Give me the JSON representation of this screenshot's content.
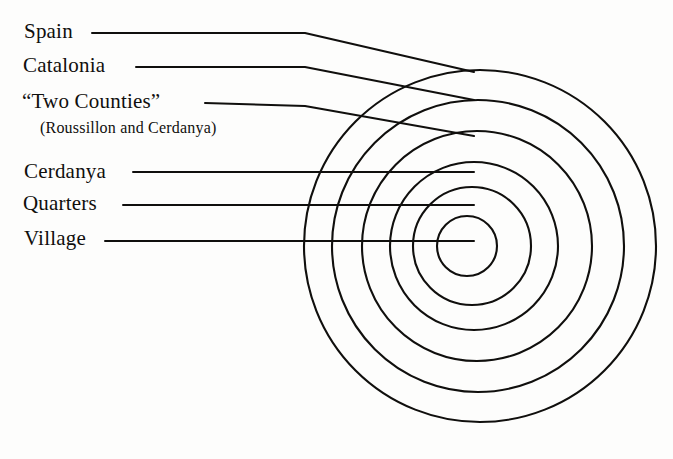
{
  "figure": {
    "background_color": "#fdfdfc",
    "stroke_color": "#100f0d"
  },
  "labels": [
    {
      "id": "spain",
      "text": "Spain"
    },
    {
      "id": "catalonia",
      "text": "Catalonia"
    },
    {
      "id": "two",
      "text": "“Two Counties”"
    },
    {
      "id": "two_sub",
      "text": "(Roussillon and Cerdanya)"
    },
    {
      "id": "cerdanya",
      "text": "Cerdanya"
    },
    {
      "id": "quarters",
      "text": "Quarters"
    },
    {
      "id": "village",
      "text": "Village"
    }
  ],
  "chart_data": {
    "type": "diagram",
    "subtype": "concentric-circles",
    "title": "",
    "center": {
      "x": 480,
      "y": 246
    },
    "rings": [
      {
        "label": "Spain",
        "index": 1,
        "radius": 176,
        "cx": 480,
        "cy": 246
      },
      {
        "label": "Catalonia",
        "index": 2,
        "radius": 146,
        "cx": 478,
        "cy": 246
      },
      {
        "label": "“Two Counties”",
        "index": 3,
        "radius": 115,
        "cx": 477,
        "cy": 246
      },
      {
        "label": "Cerdanya",
        "index": 4,
        "radius": 84,
        "cx": 474,
        "cy": 246
      },
      {
        "label": "Quarters",
        "index": 5,
        "radius": 59,
        "cx": 472,
        "cy": 246
      },
      {
        "label": "Village",
        "index": 6,
        "radius": 30,
        "cx": 467,
        "cy": 246
      }
    ],
    "leaders": [
      {
        "label": "Spain",
        "kind": "bent",
        "x1": 92,
        "y1": 33,
        "x2": 305,
        "y2": 33,
        "x3": 474,
        "y3": 72
      },
      {
        "label": "Catalonia",
        "kind": "bent",
        "x1": 136,
        "y1": 67,
        "x2": 305,
        "y2": 67,
        "x3": 474,
        "y3": 100
      },
      {
        "label": "“Two Counties”",
        "kind": "bent",
        "x1": 205,
        "y1": 103,
        "x2": 305,
        "y2": 106,
        "x3": 474,
        "y3": 136
      },
      {
        "label": "Cerdanya",
        "kind": "horizontal",
        "x1": 133,
        "y1": 172,
        "x2": 474,
        "y2": 172
      },
      {
        "label": "Quarters",
        "kind": "horizontal",
        "x1": 123,
        "y1": 205,
        "x2": 474,
        "y2": 205
      },
      {
        "label": "Village",
        "kind": "horizontal",
        "x1": 105,
        "y1": 241,
        "x2": 474,
        "y2": 241
      }
    ],
    "legend_position": "left",
    "grid": false,
    "note": "Six nested concentric circles representing successively larger territorial units, each annotated by a leader line to a label on the left."
  }
}
